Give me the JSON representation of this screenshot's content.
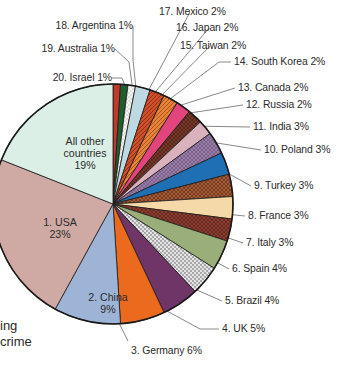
{
  "chart_data": {
    "type": "pie",
    "title": "",
    "units": "percent",
    "legend_position": "callout-labels",
    "grid": false,
    "start_angle_deg": 0,
    "direction": "clockwise",
    "categories": [
      "20. Israel",
      "19. Australia",
      "18. Argentina",
      "17. Mexico",
      "16. Japan",
      "15. Taiwan",
      "14. South Korea",
      "13. Canada",
      "12. Russia",
      "11. India",
      "10. Poland",
      "9. Turkey",
      "8. France",
      "7. Italy",
      "6. Spain",
      "5. Brazil",
      "4. UK",
      "3. Germany",
      "2. China",
      "1. USA",
      "All other countries"
    ],
    "values": [
      1,
      1,
      1,
      2,
      2,
      2,
      2,
      2,
      2,
      3,
      3,
      3,
      3,
      3,
      4,
      4,
      5,
      6,
      9,
      23,
      19
    ],
    "slice_labels": [
      "20. Israel 1%",
      "19. Australia 1%",
      "18. Argentina 1%",
      "17. Mexico 2%",
      "16. Japan 2%",
      "15. Taiwan 2%",
      "14. South Korea 2%",
      "13. Canada 2%",
      "12. Russia 2%",
      "11. India 3%",
      "10. Poland 3%",
      "9. Turkey 3%",
      "8. France 3%",
      "7. Italy 3%",
      "6. Spain 4%",
      "5. Brazil 4%",
      "4. UK 5%",
      "3. Germany 6%",
      "2. China 9%",
      "1. USA 23%",
      "All other countries 19%"
    ],
    "colors": [
      "#c0392b",
      "#1f5c2e",
      "#f2f2ef",
      "#bfd9e2",
      "#d1502a",
      "#e8833a",
      "#e2447c",
      "#7b3a2a",
      "#d9b2bd",
      "#9b7fa8",
      "#1f6fb4",
      "#a35c3a",
      "#f6d9a8",
      "#8e3f33",
      "#9aae79",
      "#d8d8d8",
      "#6f3566",
      "#ec6a1e",
      "#9db4d6",
      "#cfa9a3",
      "#dcefe6"
    ]
  },
  "callouts": {
    "left_top": [
      {
        "text": "18. Argentina 1%"
      },
      {
        "text": "19. Australia 1%"
      },
      {
        "text": "20. Israel 1%"
      }
    ],
    "right": [
      {
        "text": "17. Mexico 2%"
      },
      {
        "text": "16. Japan 2%"
      },
      {
        "text": "15. Taiwan 2%"
      },
      {
        "text": "14. South Korea 2%"
      },
      {
        "text": "13. Canada 2%"
      },
      {
        "text": "12. Russia 2%"
      },
      {
        "text": "11. India 3%"
      },
      {
        "text": "10. Poland 3%"
      },
      {
        "text": "9. Turkey 3%"
      },
      {
        "text": "8. France 3%"
      },
      {
        "text": "7. Italy 3%"
      },
      {
        "text": "6. Spain 4%"
      },
      {
        "text": "5. Brazil 4%"
      }
    ],
    "bottom": [
      {
        "text": "4. UK 5%"
      },
      {
        "text": "3. Germany 6%"
      }
    ]
  },
  "inner_labels": {
    "all_other": {
      "line1": "All other",
      "line2": "countries",
      "line3": "19%"
    },
    "usa": {
      "line1": "1. USA",
      "line2": "23%"
    },
    "china": {
      "line1": "2. China",
      "line2": "9%"
    }
  },
  "cropped_caption": {
    "line1": "ing",
    "line2": "crime"
  }
}
